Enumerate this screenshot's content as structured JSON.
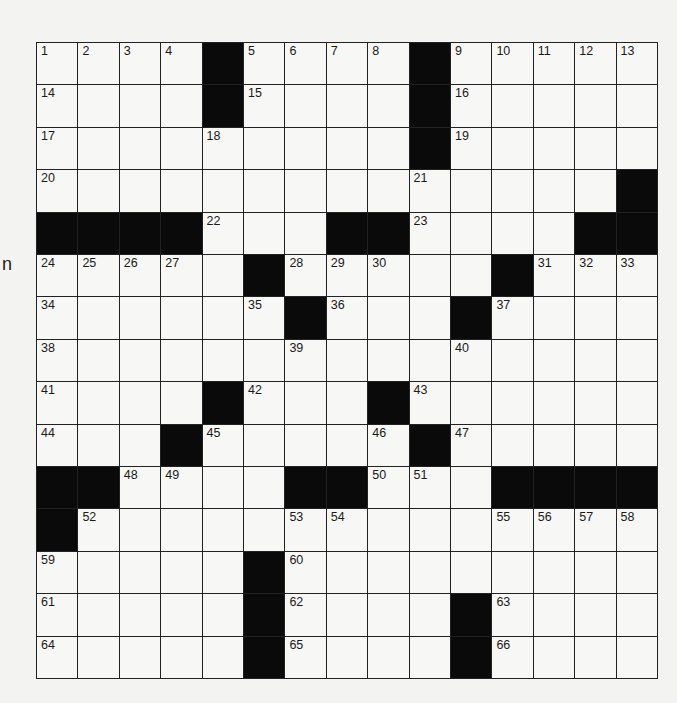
{
  "side_text": "n",
  "puzzle": {
    "rows": 15,
    "cols": 15,
    "grid": [
      [
        "1",
        "2",
        "3",
        "4",
        "#",
        "5",
        "6",
        "7",
        "8",
        "#",
        "9",
        "10",
        "11",
        "12",
        "13"
      ],
      [
        "14",
        "",
        "",
        "",
        "#",
        "15",
        "",
        "",
        "",
        "#",
        "16",
        "",
        "",
        "",
        ""
      ],
      [
        "17",
        "",
        "",
        "",
        "18",
        "",
        "",
        "",
        "",
        "#",
        "19",
        "",
        "",
        "",
        ""
      ],
      [
        "20",
        "",
        "",
        "",
        "",
        "",
        "",
        "",
        "",
        "21",
        "",
        "",
        "",
        "",
        "#"
      ],
      [
        "#",
        "#",
        "#",
        "#",
        "22",
        "",
        "",
        "#",
        "#",
        "23",
        "",
        "",
        "",
        "#",
        "#"
      ],
      [
        "24",
        "25",
        "26",
        "27",
        "",
        "#",
        "28",
        "29",
        "30",
        "",
        "",
        "#",
        "31",
        "32",
        "33"
      ],
      [
        "34",
        "",
        "",
        "",
        "",
        "35",
        "#",
        "36",
        "",
        "",
        "#",
        "37",
        "",
        "",
        ""
      ],
      [
        "38",
        "",
        "",
        "",
        "",
        "",
        "39",
        "",
        "",
        "",
        "40",
        "",
        "",
        "",
        ""
      ],
      [
        "41",
        "",
        "",
        "",
        "#",
        "42",
        "",
        "",
        "#",
        "43",
        "",
        "",
        "",
        "",
        ""
      ],
      [
        "44",
        "",
        "",
        "#",
        "45",
        "",
        "",
        "",
        "46",
        "#",
        "47",
        "",
        "",
        "",
        ""
      ],
      [
        "#",
        "#",
        "48",
        "49",
        "",
        "",
        "#",
        "#",
        "50",
        "51",
        "",
        "#",
        "#",
        "#",
        "#"
      ],
      [
        "#",
        "52",
        "",
        "",
        "",
        "",
        "53",
        "54",
        "",
        "",
        "",
        "55",
        "56",
        "57",
        "58"
      ],
      [
        "59",
        "",
        "",
        "",
        "",
        "#",
        "60",
        "",
        "",
        "",
        "",
        "",
        "",
        "",
        ""
      ],
      [
        "61",
        "",
        "",
        "",
        "",
        "#",
        "62",
        "",
        "",
        "",
        "#",
        "63",
        "",
        "",
        ""
      ],
      [
        "64",
        "",
        "",
        "",
        "",
        "#",
        "65",
        "",
        "",
        "",
        "#",
        "66",
        "",
        "",
        ""
      ]
    ]
  },
  "colors": {
    "block": "#0a0a0a",
    "cell": "#f7f7f5",
    "line": "#222222"
  }
}
